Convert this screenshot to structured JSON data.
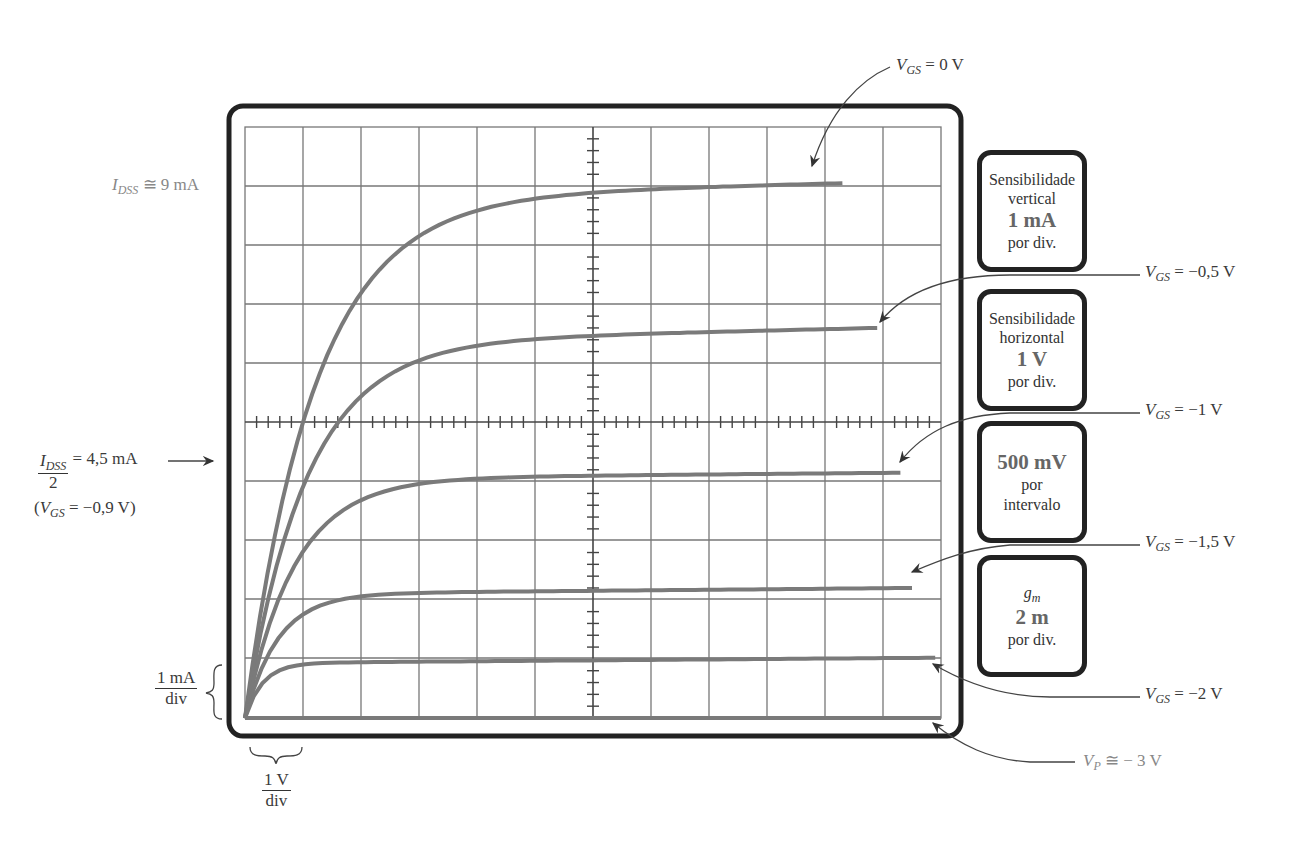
{
  "chart_data": {
    "type": "line",
    "xlabel": "V_DS",
    "ylabel": "I_D",
    "x_unit": "V",
    "y_unit": "mA",
    "xlim": [
      0,
      12
    ],
    "ylim": [
      0,
      10
    ],
    "grid": true,
    "x_divisions": 12,
    "y_divisions": 10,
    "x": [
      0,
      0.5,
      1,
      1.5,
      2,
      3,
      4,
      5,
      6,
      8,
      10,
      12
    ],
    "series": [
      {
        "name": "V_GS = 0 V",
        "values": [
          0,
          3.9,
          6.0,
          7.2,
          7.9,
          8.4,
          8.6,
          8.7,
          8.8,
          8.9,
          9.05,
          null
        ],
        "end_x": 10.3
      },
      {
        "name": "V_GS = -0,5 V",
        "values": [
          0,
          2.6,
          4.2,
          5.2,
          5.7,
          6.1,
          6.25,
          6.3,
          6.35,
          6.45,
          6.6,
          null
        ],
        "end_x": 10.9
      },
      {
        "name": "V_GS = -1 V",
        "values": [
          0,
          1.7,
          2.8,
          3.4,
          3.7,
          3.95,
          4.0,
          4.02,
          4.05,
          4.1,
          4.15,
          null
        ],
        "end_x": 11.3
      },
      {
        "name": "V_GS = -1,5 V",
        "values": [
          0,
          0.9,
          1.5,
          1.85,
          2.0,
          2.05,
          2.07,
          2.08,
          2.1,
          2.15,
          2.2,
          null
        ],
        "end_x": 11.5
      },
      {
        "name": "V_GS = -2 V",
        "values": [
          0,
          0.45,
          0.7,
          0.8,
          0.85,
          0.88,
          0.9,
          0.92,
          0.93,
          0.96,
          1.0,
          1.02
        ],
        "end_x": 11.9
      },
      {
        "name": "V_P ≅ -3 V",
        "values": [
          0,
          0,
          0,
          0,
          0,
          0,
          0,
          0,
          0,
          0,
          0,
          0
        ],
        "end_x": 12
      }
    ],
    "annotations": [
      "I_DSS ≅ 9 mA",
      "I_DSS/2 = 4,5 mA (V_GS = -0,9 V)",
      "1 mA/div",
      "1 V/div"
    ]
  },
  "labels": {
    "idss": {
      "sym": "I",
      "sub": "DSS",
      "rest": " ≅ 9 mA"
    },
    "idss_half": {
      "num_sym": "I",
      "num_sub": "DSS",
      "den": "2",
      "rest": " = 4,5 mA",
      "paren_open": "(",
      "vgs_sym": "V",
      "vgs_sub": "GS",
      "vgs_rest": " = −0,9 V)"
    },
    "vdiv_num": "1 mA",
    "vdiv_den": "div",
    "hdiv_num": "1 V",
    "hdiv_den": "div",
    "curves": [
      {
        "sym": "V",
        "sub": "GS",
        "rest": " = 0 V"
      },
      {
        "sym": "V",
        "sub": "GS",
        "rest": " = −0,5 V"
      },
      {
        "sym": "V",
        "sub": "GS",
        "rest": " = −1 V"
      },
      {
        "sym": "V",
        "sub": "GS",
        "rest": " = −1,5 V"
      },
      {
        "sym": "V",
        "sub": "GS",
        "rest": " = −2 V"
      },
      {
        "sym": "V",
        "sub": "P",
        "rest": " ≅ − 3 V"
      }
    ]
  },
  "panels": [
    {
      "line1": "Sensibilidade",
      "line2": "vertical",
      "value": "1 mA",
      "line4": "por div."
    },
    {
      "line1": "Sensibilidade",
      "line2": "horizontal",
      "value": "1 V",
      "line4": "por div."
    },
    {
      "value": "500 mV",
      "line2": "por",
      "line3": "intervalo"
    },
    {
      "sym": "g",
      "sub": "m",
      "value": "2 m",
      "line4": "por div."
    }
  ],
  "colors": {
    "curve": "#7a7a7a",
    "grid": "#777777",
    "frame": "#222222"
  }
}
